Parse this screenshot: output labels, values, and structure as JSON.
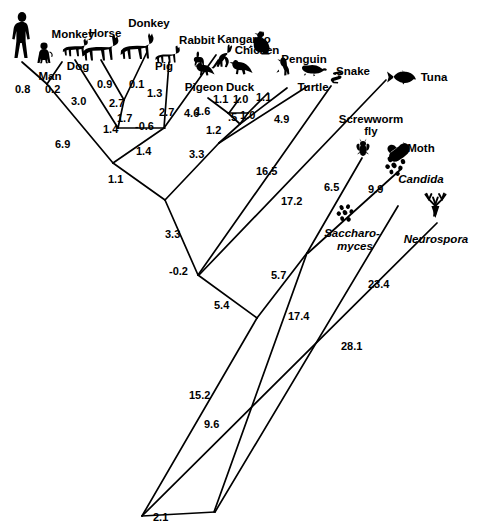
{
  "figure": {
    "type": "phylogenetic-tree",
    "title": ""
  },
  "taxa": [
    {
      "id": "man",
      "label": "Man",
      "x": 50,
      "y": 71,
      "anchor": "middle",
      "italic": false
    },
    {
      "id": "monkey",
      "label": "Monkey",
      "x": 73,
      "y": 36,
      "anchor": "middle",
      "italic": false
    },
    {
      "id": "dog",
      "label": "Dog",
      "x": 78,
      "y": 70,
      "anchor": "middle",
      "italic": false
    },
    {
      "id": "horse",
      "label": "Horse",
      "x": 105,
      "y": 36,
      "anchor": "middle",
      "italic": false
    },
    {
      "id": "donkey",
      "label": "Donkey",
      "x": 149,
      "y": 26,
      "anchor": "middle",
      "italic": false
    },
    {
      "id": "pig",
      "label": "Pig",
      "x": 163,
      "y": 70,
      "anchor": "middle",
      "italic": false
    },
    {
      "id": "rabbit",
      "label": "Rabbit",
      "x": 198,
      "y": 41,
      "anchor": "middle",
      "italic": false
    },
    {
      "id": "kangaroo",
      "label": "Kangaroo",
      "x": 244,
      "y": 41,
      "anchor": "middle",
      "italic": false
    },
    {
      "id": "pigeon",
      "label": "Pigeon",
      "x": 204,
      "y": 90,
      "anchor": "middle",
      "italic": false
    },
    {
      "id": "duck",
      "label": "Duck",
      "x": 239,
      "y": 90,
      "anchor": "middle",
      "italic": false
    },
    {
      "id": "chicken",
      "label": "Chicken",
      "x": 255,
      "y": 53,
      "anchor": "middle",
      "italic": false
    },
    {
      "id": "penguin",
      "label": "Penguin",
      "x": 302,
      "y": 62,
      "anchor": "middle",
      "italic": false
    },
    {
      "id": "turtle",
      "label": "Turtle",
      "x": 313,
      "y": 90,
      "anchor": "middle",
      "italic": false
    },
    {
      "id": "snake",
      "label": "Snake",
      "x": 352,
      "y": 74,
      "anchor": "middle",
      "italic": false
    },
    {
      "id": "tuna",
      "label": "Tuna",
      "x": 434,
      "y": 79,
      "anchor": "middle",
      "italic": false
    },
    {
      "id": "screwworm",
      "label": "Screwworm",
      "x": 371,
      "y": 122,
      "anchor": "middle",
      "italic": false
    },
    {
      "id": "screwworm2",
      "label": "fly",
      "x": 371,
      "y": 134,
      "anchor": "middle",
      "italic": false
    },
    {
      "id": "moth",
      "label": "Moth",
      "x": 421,
      "y": 151,
      "anchor": "middle",
      "italic": false
    },
    {
      "id": "candida",
      "label": "Candida",
      "x": 421,
      "y": 182,
      "anchor": "middle",
      "italic": true
    },
    {
      "id": "saccharomyces",
      "label": "Saccharo-",
      "x": 352,
      "y": 235,
      "anchor": "middle",
      "italic": true
    },
    {
      "id": "saccharomyces2",
      "label": "myces",
      "x": 352,
      "y": 248,
      "anchor": "middle",
      "italic": true
    },
    {
      "id": "neurospora",
      "label": "Neurospora",
      "x": 436,
      "y": 241,
      "anchor": "middle",
      "italic": true
    }
  ],
  "distances": [
    {
      "id": "d-man",
      "value": "0.8",
      "x": 15,
      "y": 90
    },
    {
      "id": "d-monkey",
      "value": "0.2",
      "x": 45,
      "y": 90
    },
    {
      "id": "d-dog",
      "value": "3.0",
      "x": 78,
      "y": 102
    },
    {
      "id": "d-horse",
      "value": "0.9",
      "x": 105,
      "y": 84
    },
    {
      "id": "d-donkey",
      "value": "0.1",
      "x": 135,
      "y": 84
    },
    {
      "id": "d-horsedonkey",
      "value": "2.7",
      "x": 115,
      "y": 104
    },
    {
      "id": "d-pig",
      "value": "1.3",
      "x": 153,
      "y": 93
    },
    {
      "id": "d-artio",
      "value": "1.7",
      "x": 123,
      "y": 118
    },
    {
      "id": "d-ungulate",
      "value": "2.7",
      "x": 165,
      "y": 113
    },
    {
      "id": "d-mamnode",
      "value": "1.4",
      "x": 114,
      "y": 130
    },
    {
      "id": "d-neg06",
      "value": "-0.6",
      "x": 147,
      "y": 128
    },
    {
      "id": "d-kangaroo",
      "value": "4.6",
      "x": 190,
      "y": 114
    },
    {
      "id": "d-man-monkey-base",
      "value": "6.9",
      "x": 62,
      "y": 145
    },
    {
      "id": "d-mammal-stem",
      "value": "1.4",
      "x": 142,
      "y": 152
    },
    {
      "id": "d-mammal-root",
      "value": "1.1",
      "x": 115,
      "y": 180
    },
    {
      "id": "d-pigeon",
      "value": "1.1",
      "x": 220,
      "y": 100
    },
    {
      "id": "d-duck",
      "value": "1.0",
      "x": 239,
      "y": 100
    },
    {
      "id": "d-chicken",
      "value": "1.1",
      "x": 262,
      "y": 99
    },
    {
      "id": "d-birdstem1",
      "value": "1.6",
      "x": 202,
      "y": 112
    },
    {
      "id": "d-birdhalf",
      "value": ".5",
      "x": 231,
      "y": 118
    },
    {
      "id": "d-birdnode",
      "value": "1.0",
      "x": 248,
      "y": 116
    },
    {
      "id": "d-birdbase",
      "value": "1.2",
      "x": 213,
      "y": 131
    },
    {
      "id": "d-turtle",
      "value": "4.9",
      "x": 281,
      "y": 120
    },
    {
      "id": "d-amniote",
      "value": "3.3",
      "x": 196,
      "y": 155
    },
    {
      "id": "d-snake",
      "value": "16.5",
      "x": 263,
      "y": 172
    },
    {
      "id": "d-tuna",
      "value": "17.2",
      "x": 288,
      "y": 202
    },
    {
      "id": "d-vert",
      "value": "3.3",
      "x": 172,
      "y": 235
    },
    {
      "id": "d-neg02",
      "value": "-0.2",
      "x": 180,
      "y": 272
    },
    {
      "id": "d-screwworm",
      "value": "6.5",
      "x": 330,
      "y": 188
    },
    {
      "id": "d-moth",
      "value": "9.9",
      "x": 374,
      "y": 190
    },
    {
      "id": "d-insect",
      "value": "5.7",
      "x": 277,
      "y": 276
    },
    {
      "id": "d-deep54",
      "value": "5.4",
      "x": 221,
      "y": 306
    },
    {
      "id": "d-fungi174",
      "value": "17.4",
      "x": 296,
      "y": 317
    },
    {
      "id": "d-candida",
      "value": "23.4",
      "x": 376,
      "y": 285
    },
    {
      "id": "d-neurospora",
      "value": "28.1",
      "x": 349,
      "y": 347
    },
    {
      "id": "d-root152",
      "value": "15.2",
      "x": 197,
      "y": 396
    },
    {
      "id": "d-root96",
      "value": "9.6",
      "x": 211,
      "y": 425
    },
    {
      "id": "d-root21",
      "value": "2.1",
      "x": 160,
      "y": 518
    }
  ],
  "branches": [
    {
      "id": "b-man",
      "from": [
        22,
        62
      ],
      "to": [
        47,
        84
      ],
      "note": "0.8"
    },
    {
      "id": "b-monkey",
      "from": [
        62,
        62
      ],
      "to": [
        47,
        84
      ],
      "note": "0.2"
    },
    {
      "id": "b-hominoid-stem",
      "from": [
        47,
        84
      ],
      "to": [
        113,
        163
      ],
      "note": "6.9"
    },
    {
      "id": "b-dog",
      "from": [
        75,
        60
      ],
      "to": [
        118,
        128
      ],
      "note": "3.0"
    },
    {
      "id": "b-horse",
      "from": [
        100,
        60
      ],
      "to": [
        124,
        100
      ],
      "note": "0.9"
    },
    {
      "id": "b-donkey",
      "from": [
        147,
        52
      ],
      "to": [
        124,
        100
      ],
      "note": "0.1"
    },
    {
      "id": "b-perisso-stem",
      "from": [
        124,
        100
      ],
      "to": [
        118,
        128
      ],
      "note": "2.7"
    },
    {
      "id": "b-pig",
      "from": [
        168,
        62
      ],
      "to": [
        164,
        128
      ],
      "note": "1.3"
    },
    {
      "id": "b-bar",
      "from": [
        118,
        128
      ],
      "to": [
        164,
        128
      ],
      "note": "-0.6"
    },
    {
      "id": "b-mammal-stem",
      "from": [
        164,
        128
      ],
      "to": [
        113,
        163
      ],
      "note": "1.4"
    },
    {
      "id": "b-kangaroo",
      "from": [
        215,
        55
      ],
      "to": [
        164,
        128
      ],
      "note": "4.6"
    },
    {
      "id": "b-mammal-root",
      "from": [
        113,
        163
      ],
      "to": [
        165,
        200
      ],
      "note": "1.1"
    },
    {
      "id": "b-pigeon",
      "from": [
        208,
        99
      ],
      "to": [
        228,
        113
      ],
      "note": "1.1"
    },
    {
      "id": "b-duck",
      "from": [
        240,
        99
      ],
      "to": [
        228,
        113
      ],
      "note": "1.0"
    },
    {
      "id": "b-chicken",
      "from": [
        268,
        93
      ],
      "to": [
        247,
        113
      ],
      "note": "1.1"
    },
    {
      "id": "b-bird-bar",
      "from": [
        228,
        113
      ],
      "to": [
        247,
        113
      ],
      "note": "bar"
    },
    {
      "id": "b-bird-half",
      "from": [
        228,
        113
      ],
      "to": [
        240,
        124
      ],
      "note": ".5"
    },
    {
      "id": "b-bird-node",
      "from": [
        247,
        113
      ],
      "to": [
        240,
        124
      ],
      "note": "1.0"
    },
    {
      "id": "b-penguin",
      "from": [
        286,
        88
      ],
      "to": [
        240,
        124
      ],
      "note": "1.6"
    },
    {
      "id": "b-bird-base",
      "from": [
        240,
        124
      ],
      "to": [
        219,
        143
      ],
      "note": "1.2"
    },
    {
      "id": "b-turtle",
      "from": [
        307,
        86
      ],
      "to": [
        219,
        143
      ],
      "note": "4.9"
    },
    {
      "id": "b-amniote",
      "from": [
        219,
        143
      ],
      "to": [
        165,
        200
      ],
      "note": "3.3"
    },
    {
      "id": "b-vert",
      "from": [
        165,
        200
      ],
      "to": [
        198,
        275
      ],
      "note": "3.3"
    },
    {
      "id": "b-snake",
      "from": [
        330,
        86
      ],
      "to": [
        198,
        275
      ],
      "note": "16.5"
    },
    {
      "id": "b-tuna",
      "from": [
        385,
        80
      ],
      "to": [
        198,
        275
      ],
      "note": "17.2"
    },
    {
      "id": "b-deep54",
      "from": [
        198,
        275
      ],
      "to": [
        257,
        318
      ],
      "note": "5.4"
    },
    {
      "id": "b-screwworm",
      "from": [
        362,
        158
      ],
      "to": [
        307,
        253
      ],
      "note": "6.5"
    },
    {
      "id": "b-moth",
      "from": [
        399,
        170
      ],
      "to": [
        307,
        253
      ],
      "note": "9.9"
    },
    {
      "id": "b-insect-stem",
      "from": [
        307,
        253
      ],
      "to": [
        257,
        318
      ],
      "note": "5.7"
    },
    {
      "id": "b-fungi174",
      "from": [
        307,
        253
      ],
      "to": [
        215,
        512
      ],
      "note": "17.4"
    },
    {
      "id": "b-candida",
      "from": [
        398,
        205
      ],
      "to": [
        215,
        512
      ],
      "note": "23.4"
    },
    {
      "id": "b-neurospora",
      "from": [
        437,
        222
      ],
      "to": [
        142,
        516
      ],
      "note": "28.1"
    },
    {
      "id": "b-root152",
      "from": [
        257,
        318
      ],
      "to": [
        142,
        516
      ],
      "note": "15.2"
    },
    {
      "id": "b-root96",
      "from": [
        215,
        512
      ],
      "to": [
        142,
        516
      ],
      "note": "9.6"
    },
    {
      "id": "b-root21",
      "from": [
        142,
        516
      ],
      "to": [
        215,
        512
      ],
      "note": "2.1"
    }
  ],
  "colors": {
    "ink": "#000000",
    "background": "#ffffff"
  }
}
